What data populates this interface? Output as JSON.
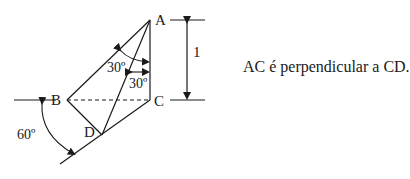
{
  "diagram": {
    "points": {
      "A": {
        "label": "A",
        "x": 150,
        "y": 20
      },
      "B": {
        "label": "B",
        "x": 67,
        "y": 100
      },
      "C": {
        "label": "C",
        "x": 150,
        "y": 100
      },
      "D": {
        "label": "D",
        "x": 102,
        "y": 135
      }
    },
    "angles": {
      "angle_BAD": "30º",
      "angle_DAC": "30º",
      "angle_slope": "60º"
    },
    "dimension": {
      "label": "1",
      "from": "A",
      "to": "C"
    },
    "caption": "AC é perpendicular a CD.",
    "colors": {
      "stroke": "#1a1a1a",
      "background": "#ffffff"
    }
  }
}
